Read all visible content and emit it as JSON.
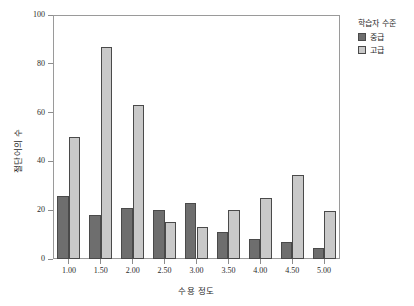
{
  "chart_data": {
    "type": "bar",
    "title": "",
    "subtitle": "",
    "xlabel": "수용 정도",
    "ylabel": "절단어의 수",
    "categories": [
      "1.00",
      "1.50",
      "2.00",
      "2.50",
      "3.00",
      "3.50",
      "4.00",
      "4.50",
      "5.00"
    ],
    "series": [
      {
        "name": "중급",
        "color": "#6e6e6e",
        "values": [
          26,
          18,
          21,
          20,
          23,
          11,
          8,
          7,
          4.5
        ]
      },
      {
        "name": "고급",
        "color": "#c9c9c9",
        "values": [
          50,
          87,
          63,
          15,
          13,
          20,
          25,
          34.5,
          19.5
        ]
      }
    ],
    "ylim": [
      0,
      100
    ],
    "yticks": [
      0,
      20,
      40,
      60,
      80,
      100
    ],
    "ytick_labels": [
      "0",
      "20",
      "40",
      "60",
      "80",
      "100"
    ],
    "grid": false,
    "legend": {
      "title": "학습자 수준",
      "position": "right",
      "entries": [
        {
          "label": "중급",
          "swatch": "#6e6e6e"
        },
        {
          "label": "고급",
          "swatch": "#c9c9c9"
        }
      ]
    }
  }
}
